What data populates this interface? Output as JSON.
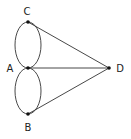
{
  "diagram": {
    "type": "graph",
    "nodes": [
      {
        "id": "C",
        "label": "C",
        "x": 28,
        "y": 22,
        "lx": 27,
        "ly": 15
      },
      {
        "id": "A",
        "label": "A",
        "x": 28,
        "y": 68,
        "lx": 10,
        "ly": 72
      },
      {
        "id": "B",
        "label": "B",
        "x": 28,
        "y": 114,
        "lx": 28,
        "ly": 130
      },
      {
        "id": "D",
        "label": "D",
        "x": 109,
        "y": 68,
        "lx": 120,
        "ly": 72
      }
    ],
    "edges": [
      {
        "from": "A",
        "to": "C",
        "kind": "arc-left"
      },
      {
        "from": "A",
        "to": "C",
        "kind": "arc-right"
      },
      {
        "from": "A",
        "to": "B",
        "kind": "arc-left"
      },
      {
        "from": "A",
        "to": "B",
        "kind": "arc-right"
      },
      {
        "from": "C",
        "to": "D",
        "kind": "line"
      },
      {
        "from": "A",
        "to": "D",
        "kind": "line"
      },
      {
        "from": "B",
        "to": "D",
        "kind": "line"
      }
    ],
    "colors": {
      "stroke": "#333333",
      "node": "#111111",
      "text": "#222222"
    }
  }
}
